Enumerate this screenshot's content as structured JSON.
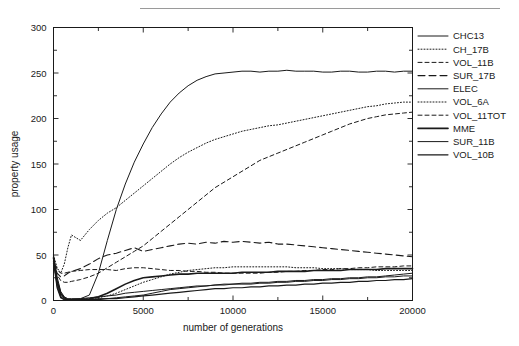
{
  "figure": {
    "top_rule": true
  },
  "chart_data": {
    "type": "line",
    "title": "",
    "xlabel": "number of generations",
    "ylabel": "property usage",
    "xlim": [
      0,
      20000
    ],
    "ylim": [
      0,
      300
    ],
    "xticks": [
      0,
      5000,
      10000,
      15000,
      20000
    ],
    "xtick_labels": [
      "0",
      "5000",
      "10000",
      "15000",
      "20000"
    ],
    "x_minor_ticks": [
      2500,
      7500,
      12500,
      17500
    ],
    "yticks": [
      0,
      50,
      100,
      150,
      200,
      250,
      300
    ],
    "ytick_labels": [
      "0",
      "50",
      "100",
      "150",
      "200",
      "250",
      "300"
    ],
    "y_minor_ticks": [
      25,
      75,
      125,
      175,
      225,
      275
    ],
    "grid": false,
    "legend_position": "right",
    "x": [
      0,
      200,
      400,
      600,
      800,
      1000,
      1500,
      2000,
      2500,
      3000,
      3500,
      4000,
      4500,
      5000,
      5500,
      6000,
      6500,
      7000,
      7500,
      8000,
      8500,
      9000,
      9500,
      10000,
      10500,
      11000,
      11500,
      12000,
      12500,
      13000,
      13500,
      14000,
      14500,
      15000,
      15500,
      16000,
      16500,
      17000,
      17500,
      18000,
      18500,
      19000,
      19500,
      20000
    ],
    "series": [
      {
        "name": "CHC13",
        "style": "solid",
        "width": 1.0,
        "values": [
          48,
          20,
          6,
          2,
          1,
          1,
          2,
          6,
          30,
          66,
          100,
          128,
          152,
          172,
          190,
          205,
          218,
          228,
          236,
          242,
          246,
          249,
          250,
          251,
          252,
          252,
          251,
          252,
          252,
          253,
          252,
          252,
          252,
          251,
          251,
          252,
          252,
          251,
          251,
          252,
          252,
          251,
          252,
          252
        ]
      },
      {
        "name": "CH_17B",
        "style": "dotted",
        "width": 1.0,
        "values": [
          50,
          36,
          30,
          40,
          58,
          72,
          66,
          78,
          88,
          96,
          102,
          110,
          118,
          126,
          134,
          142,
          150,
          157,
          163,
          168,
          173,
          177,
          180,
          183,
          186,
          188,
          190,
          192,
          193,
          195,
          197,
          199,
          201,
          203,
          205,
          207,
          209,
          211,
          213,
          214,
          216,
          217,
          218,
          218
        ]
      },
      {
        "name": "VOL_11B",
        "style": "dashed",
        "width": 1.0,
        "values": [
          46,
          34,
          30,
          30,
          31,
          32,
          33,
          34,
          34,
          34,
          33,
          35,
          36,
          36,
          35,
          34,
          33,
          33,
          32,
          32,
          31,
          31,
          30,
          30,
          30,
          30,
          30,
          31,
          31,
          32,
          32,
          33,
          33,
          34,
          34,
          35,
          35,
          36,
          36,
          37,
          37,
          37,
          38,
          38
        ]
      },
      {
        "name": "SUR_17B",
        "style": "longdash",
        "width": 1.1,
        "values": [
          44,
          30,
          26,
          27,
          30,
          32,
          35,
          40,
          46,
          50,
          52,
          55,
          58,
          54,
          56,
          58,
          60,
          62,
          63,
          62,
          64,
          63,
          65,
          64,
          65,
          64,
          63,
          64,
          62,
          62,
          61,
          60,
          59,
          58,
          57,
          56,
          55,
          54,
          53,
          52,
          51,
          50,
          49,
          48
        ]
      },
      {
        "name": "ELEC",
        "style": "solid",
        "width": 1.0,
        "values": [
          49,
          26,
          10,
          4,
          2,
          2,
          2,
          3,
          4,
          5,
          6,
          8,
          9,
          10,
          11,
          12,
          13,
          14,
          15,
          16,
          16,
          17,
          17,
          18,
          18,
          18,
          19,
          19,
          20,
          20,
          21,
          21,
          22,
          22,
          23,
          23,
          24,
          24,
          25,
          25,
          26,
          26,
          27,
          27
        ]
      },
      {
        "name": "VOL_6A",
        "style": "dotted",
        "width": 1.0,
        "values": [
          44,
          18,
          5,
          2,
          1,
          1,
          1,
          2,
          3,
          5,
          8,
          12,
          16,
          20,
          23,
          26,
          29,
          31,
          33,
          34,
          35,
          36,
          36,
          37,
          37,
          37,
          37,
          37,
          37,
          37,
          36,
          36,
          36,
          35,
          35,
          35,
          34,
          34,
          34,
          33,
          33,
          33,
          33,
          33
        ]
      },
      {
        "name": "VOL_11TOT",
        "style": "dashed",
        "width": 1.0,
        "values": [
          40,
          28,
          22,
          20,
          20,
          21,
          23,
          26,
          30,
          36,
          42,
          48,
          54,
          60,
          68,
          76,
          84,
          92,
          100,
          108,
          116,
          124,
          130,
          136,
          142,
          148,
          154,
          158,
          162,
          166,
          170,
          174,
          178,
          182,
          186,
          190,
          194,
          197,
          200,
          202,
          204,
          205,
          206,
          207
        ]
      },
      {
        "name": "MME",
        "style": "solid",
        "width": 1.6,
        "values": [
          47,
          22,
          8,
          3,
          1,
          1,
          1,
          2,
          4,
          8,
          13,
          18,
          22,
          25,
          26,
          27,
          28,
          29,
          29,
          30,
          30,
          30,
          30,
          30,
          31,
          31,
          31,
          31,
          32,
          32,
          32,
          32,
          33,
          33,
          33,
          33,
          34,
          34,
          34,
          34,
          35,
          35,
          35,
          35
        ]
      },
      {
        "name": "SUR_11B",
        "style": "solid",
        "width": 1.0,
        "values": [
          45,
          16,
          4,
          1,
          1,
          1,
          1,
          1,
          2,
          2,
          3,
          4,
          5,
          6,
          8,
          10,
          12,
          13,
          14,
          15,
          16,
          17,
          18,
          18,
          19,
          19,
          20,
          20,
          21,
          21,
          22,
          22,
          23,
          23,
          24,
          24,
          25,
          25,
          26,
          26,
          27,
          28,
          29,
          30
        ]
      },
      {
        "name": "VOL_10B",
        "style": "solid",
        "width": 1.2,
        "values": [
          43,
          14,
          3,
          1,
          0,
          0,
          0,
          1,
          1,
          2,
          2,
          3,
          4,
          5,
          6,
          7,
          8,
          9,
          10,
          11,
          12,
          13,
          13,
          14,
          14,
          15,
          15,
          16,
          16,
          17,
          17,
          18,
          18,
          19,
          19,
          20,
          20,
          21,
          21,
          22,
          22,
          23,
          23,
          24
        ]
      }
    ]
  }
}
